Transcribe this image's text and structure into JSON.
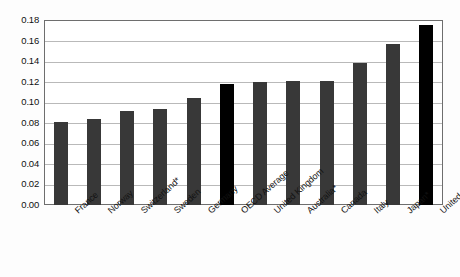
{
  "chart_data": {
    "type": "bar",
    "title": "",
    "subtitle": "",
    "xlabel": "",
    "ylabel": "",
    "ylim": [
      0.0,
      0.18
    ],
    "ytick_labels": [
      "0.18",
      "0.16",
      "0.14",
      "0.12",
      "0.10",
      "0.08",
      "0.06",
      "0.04",
      "0.02",
      "0.00"
    ],
    "ytick_values": [
      0.18,
      0.16,
      0.14,
      0.12,
      0.1,
      0.08,
      0.06,
      0.04,
      0.02,
      0.0
    ],
    "grid": true,
    "legend": "none",
    "categories": [
      "France",
      "Norway",
      "Switzerland*",
      "Sweden",
      "Germany",
      "OECD Average",
      "United Kingdom",
      "Australia*",
      "Canada",
      "Italy",
      "Japan*",
      "United States"
    ],
    "values": [
      0.081,
      0.084,
      0.091,
      0.093,
      0.104,
      0.118,
      0.12,
      0.121,
      0.121,
      0.138,
      0.157,
      0.175
    ],
    "bar_colors": [
      "#383838",
      "#383838",
      "#383838",
      "#383838",
      "#383838",
      "#000000",
      "#383838",
      "#383838",
      "#383838",
      "#383838",
      "#383838",
      "#000000"
    ],
    "highlighted_categories": [
      "OECD Average",
      "United States"
    ],
    "annotations": []
  },
  "colors": {
    "bar_default": "#383838",
    "bar_highlight": "#000000",
    "gridline": "#b9b9b9",
    "frame": "#6e6e6e",
    "background": "#fdfdfd",
    "text": "#121212"
  }
}
